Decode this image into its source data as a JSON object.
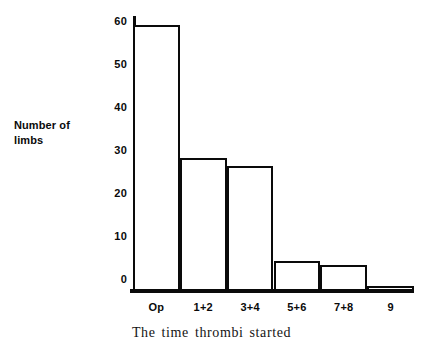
{
  "chart_data": {
    "type": "bar",
    "title": "",
    "subtitle": "",
    "xlabel": "The time thrombi started",
    "ylabel": "Number of limbs",
    "ylabel_lines": [
      "Number of",
      "limbs"
    ],
    "categories": [
      "Op",
      "1+2",
      "3+4",
      "5+6",
      "7+8",
      "9"
    ],
    "values": [
      62,
      31,
      29,
      7,
      6,
      1
    ],
    "series": [
      {
        "name": "Number of limbs",
        "values": [
          62,
          31,
          29,
          7,
          6,
          1
        ]
      }
    ],
    "ylim": [
      0,
      64
    ],
    "yticks": [
      0,
      10,
      20,
      30,
      40,
      50,
      60
    ],
    "ytick_labels": [
      "0",
      "10",
      "20",
      "30",
      "40",
      "50",
      "60"
    ],
    "grid": false,
    "legend": false,
    "legend_position": "none",
    "bar_style": {
      "fill": "#ffffff",
      "edge_color": "#0a0a0a",
      "edge_width": 2.5,
      "gap": 0
    },
    "axis_color": "#0a0a0a",
    "background": "#ffffff"
  }
}
